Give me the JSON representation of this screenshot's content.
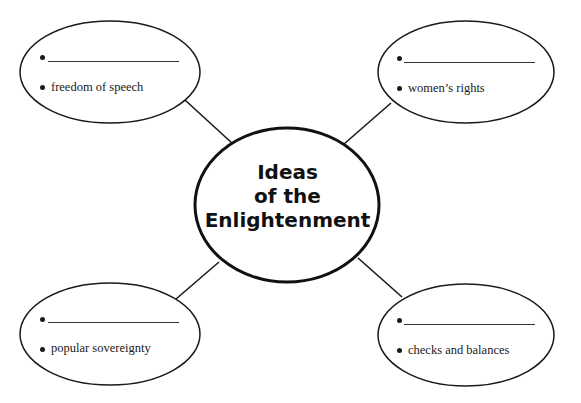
{
  "diagram": {
    "type": "concept-web",
    "center": {
      "title_lines": [
        "Ideas",
        "of the",
        "Enlightenment"
      ]
    },
    "nodes": [
      {
        "id": "top-left",
        "blank_bullet": "",
        "filled_bullet": "freedom of speech"
      },
      {
        "id": "top-right",
        "blank_bullet": "",
        "filled_bullet": "women’s rights"
      },
      {
        "id": "bottom-left",
        "blank_bullet": "",
        "filled_bullet": "popular sovereignty"
      },
      {
        "id": "bottom-right",
        "blank_bullet": "",
        "filled_bullet": "checks and balances"
      }
    ],
    "colors": {
      "stroke": "#1a1a1a",
      "background": "#ffffff"
    }
  }
}
